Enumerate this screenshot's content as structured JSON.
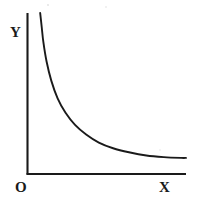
{
  "chart_data": {
    "type": "line",
    "title": "",
    "subtitle": "",
    "xlabel": "X",
    "ylabel": "Y",
    "origin_label": "O",
    "grid": false,
    "legend": null,
    "axis_style": "two-axis open (L-shaped), no tick marks, no tick labels",
    "xlim": [
      0,
      10
    ],
    "ylim": [
      0,
      10
    ],
    "series": [
      {
        "name": "decay-curve",
        "color": "#1a1a1a",
        "x": [
          0.8,
          0.9,
          1.0,
          1.2,
          1.5,
          1.9,
          2.4,
          3.0,
          3.7,
          4.5,
          5.4,
          6.4,
          7.5,
          8.6,
          9.7,
          10.0
        ],
        "y": [
          10.0,
          9.1,
          8.2,
          7.0,
          5.8,
          4.7,
          3.8,
          3.05,
          2.45,
          1.95,
          1.6,
          1.35,
          1.15,
          1.05,
          1.0,
          1.0
        ]
      }
    ],
    "annotations": []
  },
  "labels": {
    "y": "Y",
    "x": "X",
    "origin": "O"
  },
  "colors": {
    "background": "#ffffff",
    "ink": "#1a1a1a",
    "curve": "#1a1a1a",
    "axis": "#1a1a1a"
  }
}
